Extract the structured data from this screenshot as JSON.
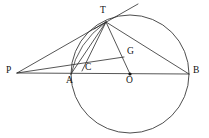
{
  "figure": {
    "kind": "geometry-diagram",
    "width": 209,
    "height": 138,
    "background_color": "#ffffff",
    "stroke_color": "#2b2b2b",
    "circle_stroke_color": "#3a3a3a",
    "label_color": "#111111"
  },
  "circle": {
    "name": "main-circle",
    "center_label": "O",
    "cx": 130,
    "cy": 74,
    "r": 59
  },
  "points": [
    {
      "id": "P",
      "label": "P",
      "x": 17,
      "y": 73,
      "label_x": 6,
      "label_y": 68,
      "dot": false
    },
    {
      "id": "T",
      "label": "T",
      "x": 106,
      "y": 22,
      "label_x": 100,
      "label_y": 8,
      "dot": false
    },
    {
      "id": "A",
      "label": "A",
      "x": 71,
      "y": 74,
      "label_x": 67,
      "label_y": 76,
      "dot": false
    },
    {
      "id": "C",
      "label": "C",
      "x": 83,
      "y": 70,
      "label_x": 86,
      "label_y": 65,
      "dot": false
    },
    {
      "id": "G",
      "label": "G",
      "x": 124,
      "y": 57,
      "label_x": 127,
      "label_y": 49,
      "dot": false
    },
    {
      "id": "O",
      "label": "O",
      "x": 130,
      "y": 74,
      "label_x": 127,
      "label_y": 76,
      "dot": true
    },
    {
      "id": "B",
      "label": "B",
      "x": 189,
      "y": 74,
      "label_x": 193,
      "label_y": 68,
      "dot": false
    }
  ],
  "segments": [
    {
      "name": "segment-P-B-baseline",
      "from": "P",
      "to": "B",
      "x1": 17,
      "y1": 73,
      "x2": 189,
      "y2": 74
    },
    {
      "name": "segment-P-T",
      "from": "P",
      "to": "T",
      "x1": 17,
      "y1": 73,
      "x2": 106,
      "y2": 22
    },
    {
      "name": "segment-P-G",
      "from": "P",
      "to": "G",
      "x1": 17,
      "y1": 73,
      "x2": 124,
      "y2": 57
    },
    {
      "name": "segment-T-B",
      "from": "T",
      "to": "B",
      "x1": 106,
      "y1": 22,
      "x2": 189,
      "y2": 74
    },
    {
      "name": "segment-T-O",
      "from": "T",
      "to": "O",
      "x1": 106,
      "y1": 22,
      "x2": 130,
      "y2": 74
    },
    {
      "name": "segment-T-A",
      "from": "T",
      "to": "A",
      "x1": 106,
      "y1": 22,
      "x2": 71,
      "y2": 74
    },
    {
      "name": "segment-T-C",
      "from": "T",
      "to": "C",
      "x1": 106,
      "y1": 22,
      "x2": 82,
      "y2": 71
    },
    {
      "name": "tangent-line-at-T",
      "from": "T",
      "to": "tangent-end",
      "x1": 94,
      "y1": 29,
      "x2": 138,
      "y2": 4
    }
  ],
  "arcs": [
    {
      "name": "arc-T-C-A",
      "path": "M 106 22 Q 78 44 71 75",
      "through": [
        "T",
        "C",
        "A"
      ]
    }
  ]
}
